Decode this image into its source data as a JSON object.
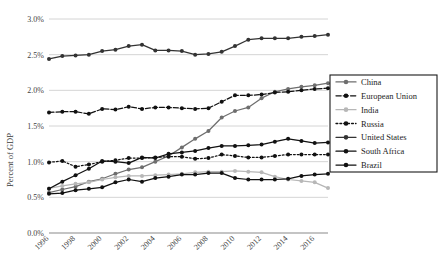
{
  "chart_data": {
    "type": "line",
    "title": "",
    "xlabel": "",
    "ylabel": "Percent of GDP",
    "ylim": [
      0.0,
      3.0
    ],
    "ytick_labels": [
      "0.0%",
      "0.5%",
      "1.0%",
      "1.5%",
      "2.0%",
      "2.5%",
      "3.0%"
    ],
    "ytick_values": [
      0.0,
      0.5,
      1.0,
      1.5,
      2.0,
      2.5,
      3.0
    ],
    "grid": true,
    "legend_position": "right",
    "x": [
      1996,
      1997,
      1998,
      1999,
      2000,
      2001,
      2002,
      2003,
      2004,
      2005,
      2006,
      2007,
      2008,
      2009,
      2010,
      2011,
      2012,
      2013,
      2014,
      2015,
      2016,
      2017
    ],
    "xtick_labels": [
      "1996",
      "1998",
      "2000",
      "2002",
      "2004",
      "2006",
      "2008",
      "2010",
      "2012",
      "2014",
      "2016"
    ],
    "xtick_values": [
      1996,
      1998,
      2000,
      2002,
      2004,
      2006,
      2008,
      2010,
      2012,
      2014,
      2016
    ],
    "series": [
      {
        "name": "China",
        "color": "#6e6e6e",
        "style": "solid",
        "values": [
          0.565,
          0.61,
          0.65,
          0.72,
          0.76,
          0.83,
          0.89,
          0.92,
          1.0,
          1.08,
          1.2,
          1.32,
          1.43,
          1.62,
          1.71,
          1.76,
          1.89,
          1.98,
          2.02,
          2.05,
          2.07,
          2.1
        ]
      },
      {
        "name": "European Union",
        "color": "#111111",
        "style": "dash-dot",
        "values": [
          1.69,
          1.7,
          1.7,
          1.67,
          1.74,
          1.73,
          1.77,
          1.74,
          1.76,
          1.76,
          1.75,
          1.74,
          1.75,
          1.84,
          1.93,
          1.93,
          1.94,
          1.97,
          1.98,
          2.0,
          2.02,
          2.03
        ]
      },
      {
        "name": "India",
        "color": "#b7b7b7",
        "style": "solid",
        "values": [
          0.625,
          0.66,
          0.69,
          0.71,
          0.75,
          0.78,
          0.8,
          0.8,
          0.81,
          0.82,
          0.83,
          0.85,
          0.86,
          0.86,
          0.87,
          0.86,
          0.85,
          0.79,
          0.75,
          0.73,
          0.71,
          0.63
        ]
      },
      {
        "name": "Russia",
        "color": "#111111",
        "style": "dotted",
        "values": [
          0.99,
          1.01,
          0.93,
          0.96,
          1.0,
          1.02,
          1.05,
          1.05,
          1.06,
          1.07,
          1.07,
          1.04,
          1.05,
          1.1,
          1.08,
          1.06,
          1.06,
          1.08,
          1.1,
          1.1,
          1.1,
          1.1
        ]
      },
      {
        "name": "United States",
        "color": "#333333",
        "style": "solid",
        "values": [
          2.44,
          2.48,
          2.49,
          2.5,
          2.55,
          2.57,
          2.62,
          2.64,
          2.56,
          2.56,
          2.55,
          2.5,
          2.51,
          2.54,
          2.62,
          2.71,
          2.73,
          2.73,
          2.73,
          2.75,
          2.76,
          2.78
        ]
      },
      {
        "name": "South Africa",
        "color": "#111111",
        "style": "solid",
        "values": [
          0.55,
          0.56,
          0.6,
          0.62,
          0.64,
          0.71,
          0.75,
          0.72,
          0.77,
          0.79,
          0.82,
          0.82,
          0.84,
          0.84,
          0.77,
          0.75,
          0.75,
          0.75,
          0.76,
          0.8,
          0.82,
          0.83
        ]
      },
      {
        "name": "Brazil",
        "color": "#111111",
        "style": "solid",
        "values": [
          0.62,
          0.72,
          0.81,
          0.9,
          1.01,
          1.0,
          0.98,
          1.06,
          1.05,
          1.11,
          1.13,
          1.15,
          1.19,
          1.22,
          1.22,
          1.23,
          1.24,
          1.28,
          1.32,
          1.29,
          1.26,
          1.27
        ]
      }
    ]
  },
  "legend": {
    "items": [
      {
        "label": "China"
      },
      {
        "label": "European Union"
      },
      {
        "label": "India"
      },
      {
        "label": "Russia"
      },
      {
        "label": "United States"
      },
      {
        "label": "South Africa"
      },
      {
        "label": "Brazil"
      }
    ]
  }
}
